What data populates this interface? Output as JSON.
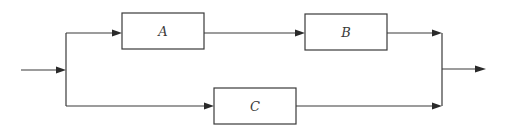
{
  "diagram": {
    "type": "block-diagram",
    "blocks": [
      {
        "id": "A",
        "label": "A",
        "x": 122,
        "y": 13,
        "w": 82,
        "h": 36
      },
      {
        "id": "B",
        "label": "B",
        "x": 305,
        "y": 14,
        "w": 82,
        "h": 36
      },
      {
        "id": "C",
        "label": "C",
        "x": 214,
        "y": 88,
        "w": 82,
        "h": 36
      }
    ],
    "connections": [
      {
        "from": "input",
        "to": "split"
      },
      {
        "from": "split",
        "to": "A"
      },
      {
        "from": "A",
        "to": "B"
      },
      {
        "from": "B",
        "to": "join"
      },
      {
        "from": "split",
        "to": "C"
      },
      {
        "from": "C",
        "to": "join"
      },
      {
        "from": "join",
        "to": "output"
      }
    ],
    "colors": {
      "stroke": "#3a3a3a",
      "background": "#ffffff"
    }
  }
}
